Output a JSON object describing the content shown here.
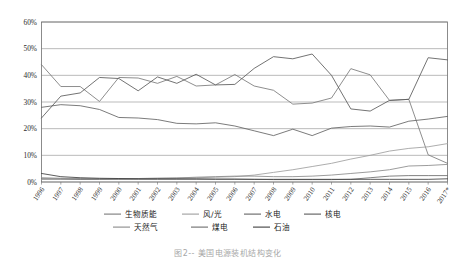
{
  "figure": {
    "caption": "图2--  美国电源装机结构变化"
  },
  "chart_data": {
    "type": "line",
    "title": "",
    "subtitle": "",
    "xlabel": "",
    "ylabel": "",
    "grid": true,
    "legend_position": "bottom",
    "ylim": [
      0,
      60
    ],
    "ytick_labels": [
      "0%",
      "10%",
      "20%",
      "30%",
      "40%",
      "50%",
      "60%"
    ],
    "ytick_values": [
      0,
      10,
      20,
      30,
      40,
      50,
      60
    ],
    "value_unit": "%",
    "categories": [
      "1996",
      "1997",
      "1998",
      "1999",
      "2000",
      "2001",
      "2002",
      "2003",
      "2004",
      "2005",
      "2006",
      "2007",
      "2008",
      "2009",
      "2010",
      "2011",
      "2012",
      "2013",
      "2014",
      "2015",
      "2016",
      "2017*"
    ],
    "series": [
      {
        "name": "生物质能",
        "color": "#7a7a7a",
        "values": [
          44.0,
          35.8,
          35.8,
          30.2,
          39.2,
          39.0,
          37.0,
          39.6,
          36.0,
          36.4,
          40.3,
          36.0,
          34.4,
          29.2,
          29.6,
          31.5,
          42.5,
          40.2,
          30.6,
          31.0,
          10.2,
          7.0
        ]
      },
      {
        "name": "风/光",
        "color": "#9e9e9e",
        "values": [
          1.0,
          1.1,
          1.0,
          1.1,
          1.2,
          1.3,
          1.4,
          1.5,
          1.6,
          1.8,
          2.0,
          2.6,
          3.6,
          4.6,
          5.8,
          7.0,
          8.6,
          10.0,
          11.6,
          12.6,
          13.2,
          14.4
        ]
      },
      {
        "name": "水电",
        "color": "#636363",
        "values": [
          28.0,
          29.0,
          28.6,
          27.2,
          24.2,
          24.0,
          23.4,
          22.0,
          21.8,
          22.2,
          21.0,
          19.2,
          17.4,
          19.8,
          17.4,
          20.2,
          20.8,
          21.0,
          20.6,
          22.8,
          23.6,
          24.6
        ]
      },
      {
        "name": "核电",
        "color": "#5a5a5a",
        "values": [
          24.0,
          32.2,
          33.4,
          39.2,
          38.8,
          34.2,
          39.4,
          37.0,
          40.4,
          36.4,
          36.6,
          42.6,
          47.0,
          46.2,
          48.0,
          40.0,
          27.4,
          26.6,
          30.6,
          31.0,
          46.6,
          45.8
        ]
      },
      {
        "name": "天然气",
        "color": "#8a8a8a",
        "values": [
          1.6,
          1.4,
          1.3,
          1.2,
          1.2,
          1.3,
          1.4,
          1.5,
          1.8,
          2.0,
          2.2,
          2.2,
          2.0,
          2.0,
          2.2,
          2.6,
          3.2,
          3.8,
          4.6,
          6.0,
          6.2,
          6.6
        ]
      },
      {
        "name": "煤电",
        "color": "#6b6b6b",
        "values": [
          1.2,
          1.1,
          1.0,
          1.0,
          1.0,
          1.0,
          1.0,
          1.0,
          1.0,
          1.0,
          1.0,
          1.0,
          0.9,
          0.9,
          0.9,
          0.9,
          1.0,
          1.6,
          2.2,
          2.4,
          2.4,
          2.4
        ]
      },
      {
        "name": "石油",
        "color": "#3f3f3f",
        "values": [
          3.2,
          2.0,
          1.6,
          1.4,
          1.3,
          1.2,
          1.2,
          1.2,
          1.2,
          1.1,
          1.1,
          1.0,
          1.0,
          1.0,
          1.0,
          1.0,
          1.0,
          1.0,
          1.0,
          1.0,
          1.0,
          1.2
        ]
      }
    ],
    "legend": [
      {
        "label": "生物质能",
        "color": "#7a7a7a"
      },
      {
        "label": "风/光",
        "color": "#9e9e9e"
      },
      {
        "label": "水电",
        "color": "#636363"
      },
      {
        "label": "核电",
        "color": "#5a5a5a"
      },
      {
        "label": "天然气",
        "color": "#8a8a8a"
      },
      {
        "label": "煤电",
        "color": "#6b6b6b"
      },
      {
        "label": "石油",
        "color": "#3f3f3f"
      }
    ]
  }
}
